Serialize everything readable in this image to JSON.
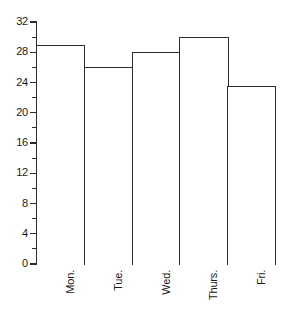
{
  "chart_data": {
    "type": "bar",
    "title": "",
    "subtitle": "",
    "xlabel": "",
    "ylabel": "",
    "categories": [
      "Mon.",
      "Tue.",
      "Wed.",
      "Thurs.",
      "Fri."
    ],
    "values": [
      29,
      26,
      28,
      30,
      23.5
    ],
    "series": [
      {
        "name": "",
        "values": [
          29,
          26,
          28,
          30,
          23.5
        ]
      }
    ],
    "ylim": [
      0,
      32
    ],
    "y_ticks": [
      0,
      4,
      8,
      12,
      16,
      20,
      24,
      28,
      32
    ],
    "y_tick_labels": [
      "0",
      "4",
      "8",
      "12",
      "16",
      "20",
      "24",
      "28",
      "32"
    ],
    "y_minor_ticks": [
      2,
      6,
      10,
      14,
      18,
      22,
      26,
      30
    ],
    "grid": false,
    "legend": "none",
    "bar_fill_color": "#ffffff",
    "bar_edge_color": "#2b2b2b",
    "axis_color": "#2b2b2b",
    "background_color": "#ffffff",
    "bar_gap": 0,
    "annotations": []
  }
}
